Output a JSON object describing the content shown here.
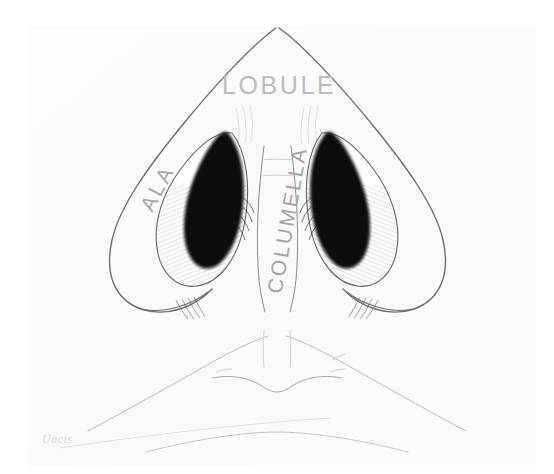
{
  "figure": {
    "kind": "anatomical-line-drawing",
    "background_color": "#ffffff",
    "paper_color": "#fcfcfc",
    "ink_color": "#5a5a5a",
    "fill_color": "#0a0a0a",
    "label_color": "#b4b4b4"
  },
  "labels": {
    "lobule": "LOBULE",
    "ala": "ALA",
    "columella": "COLUMELLA"
  },
  "signature": {
    "text": "Uacis"
  },
  "structures": [
    {
      "name": "nasal-tip-lobule",
      "label_ref": "lobule"
    },
    {
      "name": "left-ala",
      "label_ref": "ala"
    },
    {
      "name": "columella",
      "label_ref": "columella"
    },
    {
      "name": "left-nostril",
      "label_ref": null
    },
    {
      "name": "right-nostril",
      "label_ref": null
    },
    {
      "name": "upper-lip",
      "label_ref": null
    }
  ]
}
